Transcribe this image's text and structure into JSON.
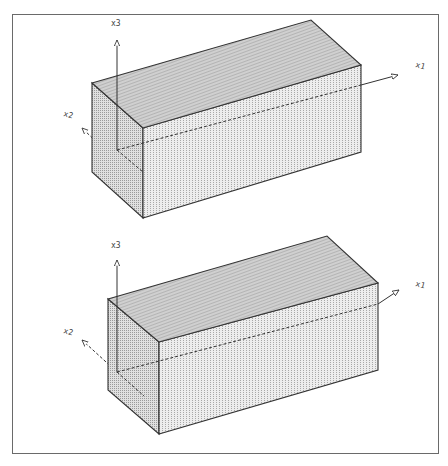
{
  "figure": {
    "panels": [
      {
        "id": "top",
        "axes": {
          "x1": {
            "label": "x1"
          },
          "x2": {
            "label": "x2"
          },
          "x3": {
            "label": "x3"
          }
        },
        "box": {
          "left_top": [
            92,
            83
          ],
          "near_top": [
            143,
            128
          ],
          "right_top": [
            361,
            65
          ],
          "back_top": [
            311,
            20
          ],
          "left_bottom": [
            92,
            172
          ],
          "near_bottom": [
            143,
            218
          ],
          "right_bottom": [
            361,
            152
          ]
        },
        "origin": [
          117,
          150
        ]
      },
      {
        "id": "bottom",
        "axes": {
          "x1": {
            "label": "x1"
          },
          "x2": {
            "label": "x2"
          },
          "x3": {
            "label": "x3"
          }
        },
        "box": {
          "left_top": [
            108,
            299
          ],
          "near_top": [
            159,
            342
          ],
          "right_top": [
            378,
            283
          ],
          "back_top": [
            327,
            236
          ],
          "left_bottom": [
            108,
            390
          ],
          "near_bottom": [
            159,
            434
          ],
          "right_bottom": [
            378,
            370
          ]
        },
        "origin": [
          117,
          372
        ]
      }
    ],
    "colors": {
      "line": "#333333",
      "frame": "#6a6a6a",
      "top_face": "#bdbdbd",
      "side_face": "#d6d6d6",
      "front_face": "#e4e4e4"
    }
  }
}
